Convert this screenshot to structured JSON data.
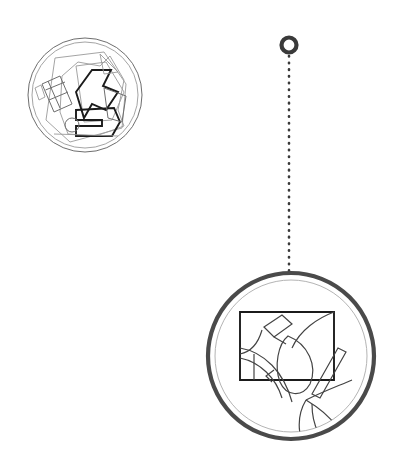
{
  "page": {
    "background_color": "#ffffff",
    "width": 395,
    "height": 463
  },
  "colors": {
    "background": "#ffffff",
    "thin_line": "#6e6e6e",
    "hairline": "#9a9a9a",
    "dark_line": "#1b1b1b",
    "mid_line": "#444444",
    "ring_outer": "#4a4a4a",
    "ring_inner": "#b4b4b4",
    "marker": "#3a3a3a",
    "leader": "#3a3a3a"
  },
  "overview_circle": {
    "name": "overview-drawing",
    "center_x": 85,
    "center_y": 95,
    "radius_outer": 57,
    "radius_inner": 53,
    "description": "Small overview circle containing an angular technical line drawing with a ladder-like hatched bar at left, folded polygon forms at upper right, a small circle detail at lower left and a boxed element at lower right"
  },
  "detail_circle": {
    "name": "detail-drawing",
    "center_x": 291,
    "center_y": 356,
    "radius_outer": 83,
    "radius_inner": 76,
    "description": "Large magnified detail circle showing an enlarged boxed region with curved organic contours, a sweeping arc, a leaf-like closed curve and a branching stem structure"
  },
  "callout": {
    "name": "magnifier-callout",
    "marker": {
      "name": "callout-marker-ring",
      "center_x": 289,
      "center_y": 45,
      "radius": 7.5,
      "stroke_width": 4.2
    },
    "leader": {
      "name": "callout-leader-line",
      "x": 289,
      "y_start": 55,
      "y_end": 272,
      "style": "dotted"
    }
  },
  "elements": {
    "overview_label": "overview",
    "detail_label": "magnified detail",
    "marker_label": "callout point"
  }
}
